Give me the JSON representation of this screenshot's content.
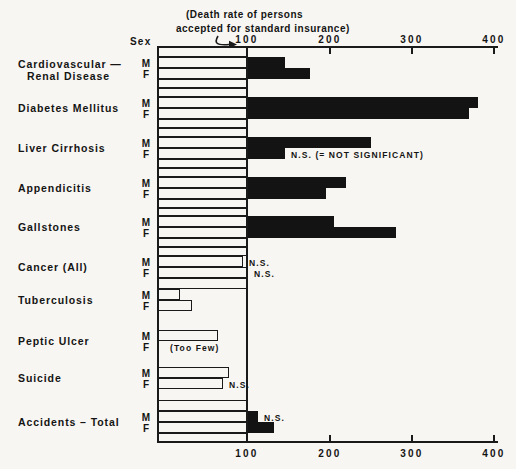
{
  "header": {
    "title_line1": "(Death rate of persons",
    "title_line2": "accepted for standard insurance)",
    "sex_label": "Sex"
  },
  "colors": {
    "background": "#f8f6f2",
    "ink": "#1a1a1a",
    "bar_fill": "#131313"
  },
  "chart_data": {
    "type": "bar",
    "orientation": "horizontal",
    "title": "(Death rate of persons accepted for standard insurance)",
    "baseline": 100,
    "xlim": [
      0,
      400
    ],
    "x_ticks": [
      100,
      200,
      300,
      400
    ],
    "sex_row_labels": [
      "M",
      "F"
    ],
    "bar_style": {
      "above_baseline": "solid-black",
      "below_baseline": "white-outlined"
    },
    "groups": [
      {
        "id": "cardiovascular-renal-disease",
        "label_lines": [
          "Cardiovascular —",
          "Renal Disease"
        ],
        "M": 145,
        "F": 175,
        "M_note": null,
        "F_note": null
      },
      {
        "id": "diabetes-mellitus",
        "label_lines": [
          "Diabetes Mellitus"
        ],
        "M": 380,
        "F": 370,
        "M_note": null,
        "F_note": null
      },
      {
        "id": "liver-cirrhosis",
        "label_lines": [
          "Liver Cirrhosis"
        ],
        "M": 250,
        "F": 145,
        "M_note": null,
        "F_note": "N.S. (= NOT SIGNIFICANT)"
      },
      {
        "id": "appendicitis",
        "label_lines": [
          "Appendicitis"
        ],
        "M": 220,
        "F": 195,
        "M_note": null,
        "F_note": null
      },
      {
        "id": "gallstones",
        "label_lines": [
          "Gallstones"
        ],
        "M": 205,
        "F": 280,
        "M_note": null,
        "F_note": null
      },
      {
        "id": "cancer-all",
        "label_lines": [
          "Cancer (All)"
        ],
        "M": 95,
        "F": 100,
        "M_note": "N.S.",
        "F_note": "N.S."
      },
      {
        "id": "tuberculosis",
        "label_lines": [
          "Tuberculosis"
        ],
        "M": 25,
        "F": 38,
        "M_note": null,
        "F_note": null
      },
      {
        "id": "peptic-ulcer",
        "label_lines": [
          "Peptic Ulcer"
        ],
        "M": 67,
        "F": null,
        "M_note": null,
        "F_note": "(Too Few)"
      },
      {
        "id": "suicide",
        "label_lines": [
          "Suicide"
        ],
        "M": 79,
        "F": 72,
        "M_note": null,
        "F_note": "N.S."
      },
      {
        "id": "accidents-total",
        "label_lines": [
          "Accidents – Total"
        ],
        "M": 112,
        "F": 132,
        "M_note": "N.S.",
        "F_note": null
      }
    ]
  }
}
